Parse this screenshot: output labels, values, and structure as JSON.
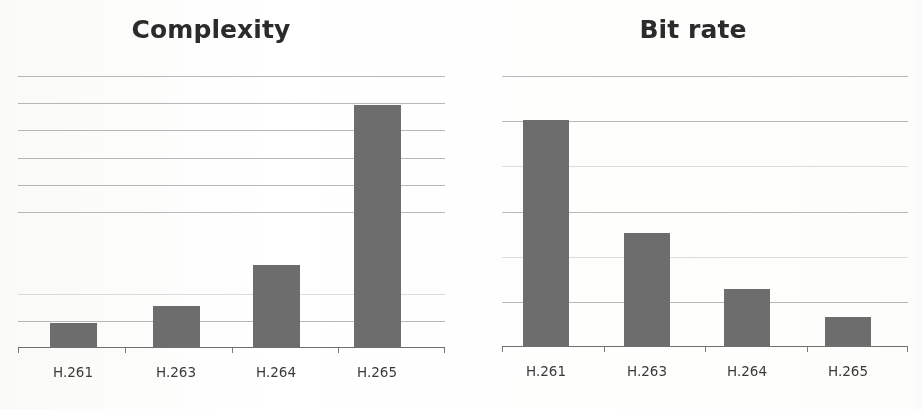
{
  "page": {
    "background_color": "#ffffff",
    "bar_color": "#6d6d6d",
    "gridline_color": "#8d8d8d",
    "axis_color": "#6f6f6f",
    "title_color": "#2b2b2b",
    "label_color": "#3a3a3a"
  },
  "chart_data": [
    {
      "type": "bar",
      "title": "Complexity",
      "xlabel": "",
      "ylabel": "",
      "categories": [
        "H.261",
        "H.263",
        "H.264",
        "H.265"
      ],
      "values": [
        0.9,
        1.5,
        3.0,
        8.9
      ],
      "ylim": [
        0,
        10
      ],
      "grid": true,
      "gridline_values": [
        10,
        9,
        8,
        7,
        6,
        5,
        2,
        1
      ],
      "tick_labels_y": [],
      "legend": null,
      "legend_position": "none"
    },
    {
      "type": "bar",
      "title": "Bit rate",
      "xlabel": "",
      "ylabel": "",
      "categories": [
        "H.261",
        "H.263",
        "H.264",
        "H.265"
      ],
      "values": [
        5.0,
        2.5,
        1.27,
        0.65
      ],
      "ylim": [
        0,
        6
      ],
      "grid": true,
      "gridline_values": [
        6,
        5,
        4,
        3,
        2,
        1
      ],
      "tick_labels_y": [],
      "legend": null,
      "legend_position": "none"
    }
  ]
}
